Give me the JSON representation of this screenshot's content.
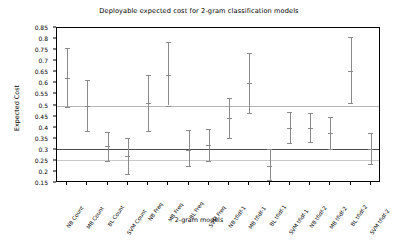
{
  "chart_data": {
    "type": "scatter",
    "title": "Deployable expected cost for 2-gram classification models",
    "xlabel": "2-gram models",
    "ylabel": "Expected Cost",
    "ylim": [
      0.15,
      0.85
    ],
    "yticks": [
      0.15,
      0.2,
      0.25,
      0.3,
      0.35,
      0.4,
      0.45,
      0.5,
      0.55,
      0.6,
      0.65,
      0.7,
      0.75,
      0.8,
      0.85
    ],
    "ytick_labels": [
      "0.15",
      "0.2",
      "0.25",
      "0.3",
      "0.35",
      "0.4",
      "0.45",
      "0.5",
      "0.55",
      "0.6",
      "0.65",
      "0.7",
      "0.75",
      "0.8",
      "0.85"
    ],
    "grid": false,
    "legend": "none",
    "categories": [
      "NB Count",
      "MB Count",
      "BL Count",
      "SVM Count",
      "NB Freq",
      "MB Freq",
      "BL Freq",
      "SVM Freq",
      "NB tfidf-1",
      "MB tfidf-1",
      "BL tfidf-1",
      "SVM tfidf-1",
      "NB tfidf-2",
      "MB tfidf-2",
      "BL tfidf-2",
      "SVM tfidf-2"
    ],
    "values": [
      0.625,
      0.5,
      0.315,
      0.27,
      0.51,
      0.64,
      0.3,
      0.32,
      0.445,
      0.6,
      0.225,
      0.4,
      0.4,
      0.375,
      0.655,
      0.305
    ],
    "err_upper": [
      0.76,
      0.615,
      0.38,
      0.355,
      0.64,
      0.785,
      0.39,
      0.395,
      0.535,
      0.735,
      0.305,
      0.47,
      0.465,
      0.45,
      0.81,
      0.375
    ],
    "err_lower": [
      0.495,
      0.385,
      0.25,
      0.19,
      0.385,
      0.5,
      0.225,
      0.25,
      0.355,
      0.465,
      0.165,
      0.33,
      0.335,
      0.305,
      0.51,
      0.235
    ],
    "reference_lines": [
      {
        "y": 0.5,
        "color": "#b4b4b4",
        "width": 1
      },
      {
        "y": 0.305,
        "color": "#4d4d4d",
        "width": 1
      },
      {
        "y": 0.255,
        "color": "#c8c8c8",
        "width": 1
      }
    ],
    "marker_color": "#8a8a8a",
    "axis_color": "#000000"
  }
}
